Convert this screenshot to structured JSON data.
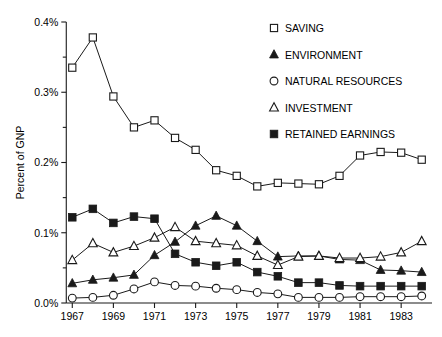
{
  "chart_data": {
    "type": "line",
    "title": "",
    "xlabel": "",
    "ylabel": "Percent of GNP",
    "xlim": [
      1966.5,
      1984.5
    ],
    "ylim": [
      0.0,
      0.4
    ],
    "grid": false,
    "legend_position": "top-right",
    "x": [
      1967,
      1968,
      1969,
      1970,
      1971,
      1972,
      1973,
      1974,
      1975,
      1976,
      1977,
      1978,
      1979,
      1980,
      1981,
      1982,
      1983,
      1984
    ],
    "xtick_labels": [
      "1967",
      "1969",
      "1971",
      "1973",
      "1975",
      "1977",
      "1979",
      "1981",
      "1983"
    ],
    "xtick_values": [
      1967,
      1969,
      1971,
      1973,
      1975,
      1977,
      1979,
      1981,
      1983
    ],
    "ytick_labels": [
      "0.0%",
      "0.1%",
      "0.2%",
      "0.3%",
      "0.4%"
    ],
    "ytick_values": [
      0.0,
      0.1,
      0.2,
      0.3,
      0.4
    ],
    "yminor_values": [
      0.05,
      0.15,
      0.25,
      0.35
    ],
    "series": [
      {
        "name": "SAVING",
        "marker": "open-square",
        "values": [
          0.335,
          0.378,
          0.294,
          0.25,
          0.26,
          0.235,
          0.218,
          0.189,
          0.181,
          0.166,
          0.171,
          0.17,
          0.169,
          0.181,
          0.21,
          0.215,
          0.214,
          0.204
        ]
      },
      {
        "name": "ENVIRONMENT",
        "marker": "filled-triangle",
        "values": [
          0.028,
          0.033,
          0.036,
          0.04,
          0.068,
          0.087,
          0.11,
          0.124,
          0.11,
          0.088,
          0.066,
          0.067,
          0.067,
          0.062,
          0.061,
          0.047,
          0.046,
          0.044
        ]
      },
      {
        "name": "NATURAL RESOURCES",
        "marker": "open-circle",
        "values": [
          0.007,
          0.008,
          0.011,
          0.02,
          0.03,
          0.025,
          0.024,
          0.021,
          0.019,
          0.015,
          0.013,
          0.008,
          0.008,
          0.008,
          0.009,
          0.009,
          0.009,
          0.01
        ]
      },
      {
        "name": "INVESTMENT",
        "marker": "open-triangle",
        "values": [
          0.061,
          0.085,
          0.072,
          0.081,
          0.093,
          0.108,
          0.088,
          0.085,
          0.082,
          0.067,
          0.054,
          0.066,
          0.067,
          0.064,
          0.064,
          0.066,
          0.072,
          0.088
        ]
      },
      {
        "name": "RETAINED EARNINGS",
        "marker": "filled-square",
        "values": [
          0.122,
          0.134,
          0.114,
          0.123,
          0.12,
          0.07,
          0.058,
          0.053,
          0.058,
          0.044,
          0.038,
          0.029,
          0.029,
          0.025,
          0.024,
          0.024,
          0.024,
          0.024
        ]
      }
    ]
  },
  "colors": {
    "ink": "#1a1a1a",
    "background": "#ffffff"
  }
}
